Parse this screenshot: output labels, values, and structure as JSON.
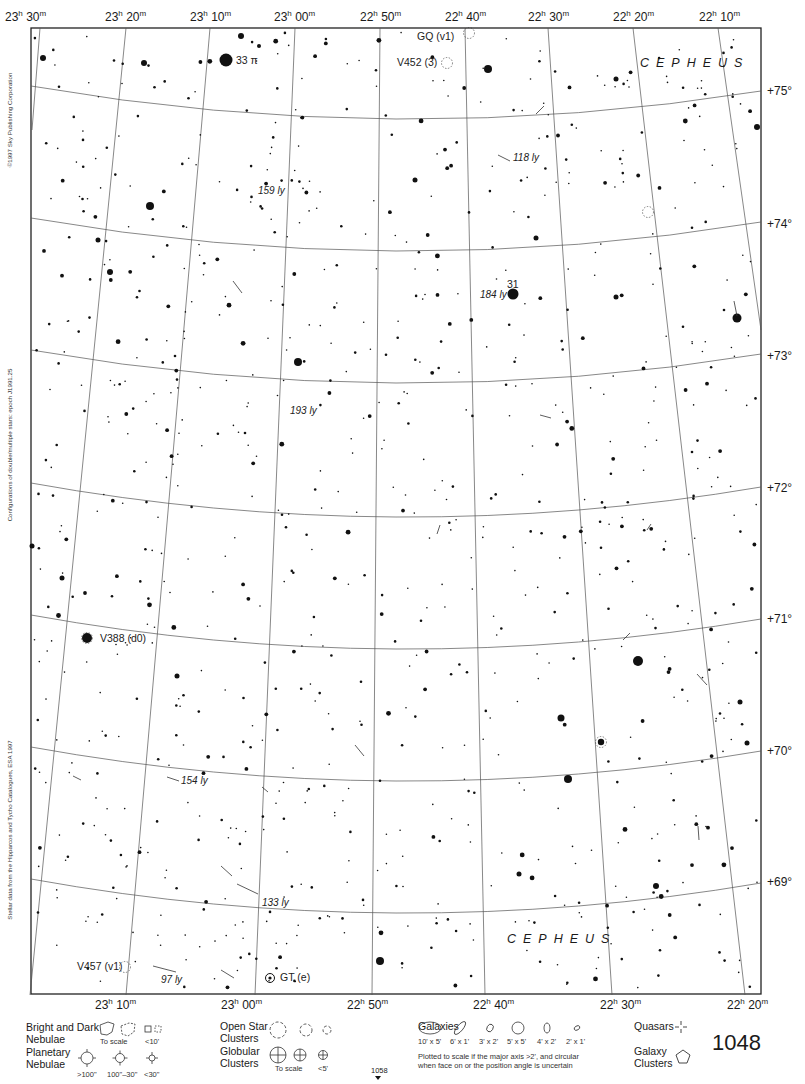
{
  "chart": {
    "constellation_labels": [
      {
        "text": "CEPHEUS",
        "x": 640,
        "y": 67
      },
      {
        "text": "CEPHEUS",
        "x": 507,
        "y": 943
      }
    ],
    "ra_top": [
      {
        "h": "23",
        "m": "30",
        "x": 5
      },
      {
        "h": "23",
        "m": "20",
        "x": 105
      },
      {
        "h": "23",
        "m": "10",
        "x": 190
      },
      {
        "h": "23",
        "m": "00",
        "x": 274
      },
      {
        "h": "22",
        "m": "50",
        "x": 360
      },
      {
        "h": "22",
        "m": "40",
        "x": 445
      },
      {
        "h": "22",
        "m": "30",
        "x": 528
      },
      {
        "h": "22",
        "m": "20",
        "x": 613
      },
      {
        "h": "22",
        "m": "10",
        "x": 699
      }
    ],
    "ra_bottom": [
      {
        "h": "23",
        "m": "10",
        "x": 95
      },
      {
        "h": "23",
        "m": "00",
        "x": 221
      },
      {
        "h": "22",
        "m": "50",
        "x": 347
      },
      {
        "h": "22",
        "m": "40",
        "x": 473
      },
      {
        "h": "22",
        "m": "30",
        "x": 600
      },
      {
        "h": "22",
        "m": "20",
        "x": 727
      }
    ],
    "dec_labels": [
      {
        "text": "+75°",
        "y": 95
      },
      {
        "text": "+74°",
        "y": 228
      },
      {
        "text": "+73°",
        "y": 360
      },
      {
        "text": "+72°",
        "y": 492
      },
      {
        "text": "+71°",
        "y": 623
      },
      {
        "text": "+70°",
        "y": 755
      },
      {
        "text": "+69°",
        "y": 886
      }
    ],
    "side_notes": [
      {
        "text": "©1997 Sky Publishing Corporation",
        "y": 120
      },
      {
        "text": "Configurations of double/multiple stars: epoch J1991.25",
        "y": 445
      },
      {
        "text": "Stellar data from the Hipparcos and Tycho Catalogues, ESA 1997",
        "y": 830
      }
    ],
    "labeled_objects": [
      {
        "name": "33 π",
        "x": 236,
        "y": 64,
        "italic": false
      },
      {
        "name": "GQ (v1)",
        "x": 417,
        "y": 40,
        "italic": false
      },
      {
        "name": "V452 (3)",
        "x": 397,
        "y": 66,
        "italic": false
      },
      {
        "name": "118 ly",
        "x": 513,
        "y": 161,
        "italic": true
      },
      {
        "name": "159 ly",
        "x": 258,
        "y": 194,
        "italic": true
      },
      {
        "name": "31",
        "x": 507,
        "y": 288,
        "italic": false
      },
      {
        "name": "184 ly",
        "x": 480,
        "y": 298,
        "italic": true
      },
      {
        "name": "193 ly",
        "x": 290,
        "y": 414,
        "italic": true
      },
      {
        "name": "V388 (d0)",
        "x": 100,
        "y": 642,
        "italic": false
      },
      {
        "name": "154 ly",
        "x": 181,
        "y": 784,
        "italic": true
      },
      {
        "name": "133 ly",
        "x": 262,
        "y": 906,
        "italic": true
      },
      {
        "name": "V457 (v1)",
        "x": 77,
        "y": 970,
        "italic": false
      },
      {
        "name": "97 ly",
        "x": 161,
        "y": 983,
        "italic": true
      },
      {
        "name": "GT (e)",
        "x": 280,
        "y": 981,
        "italic": false
      }
    ]
  },
  "legend": {
    "bright_dark_nebulae": {
      "title_1": "Bright and Dark",
      "title_2": "Nebulae",
      "to_scale": "To scale",
      "small": "<10'"
    },
    "planetary_nebulae": {
      "title_1": "Planetary",
      "title_2": "Nebulae",
      "sizes": [
        ">100\"",
        "100\"–30\"",
        "<30\""
      ]
    },
    "open_star_clusters": {
      "title_1": "Open Star",
      "title_2": "Clusters"
    },
    "globular_clusters": {
      "title_1": "Globular",
      "title_2": "Clusters",
      "to_scale": "To scale",
      "small": "<5'"
    },
    "galaxies": {
      "title": "Galaxies",
      "sizes": [
        "10' x 5'",
        "6' x 1'",
        "3' x 2'",
        "5' x 5'",
        "4' x 2'",
        "2' x 1'"
      ],
      "note_1": "Plotted to scale if the major axis >2', and circular",
      "note_2": "when face on or the position angle is uncertain"
    },
    "quasars": {
      "title": "Quasars"
    },
    "galaxy_clusters": {
      "title_1": "Galaxy",
      "title_2": "Clusters"
    }
  },
  "page": {
    "number": "1048",
    "adjacent_below": "1058"
  }
}
